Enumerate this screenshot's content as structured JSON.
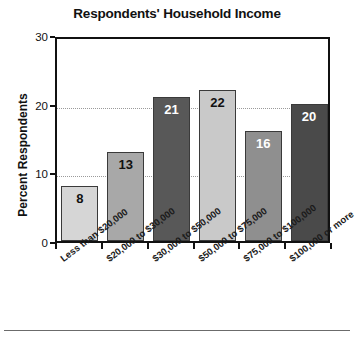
{
  "chart_data": {
    "type": "bar",
    "title": "Respondents' Household Income",
    "xlabel": "",
    "ylabel": "Percent Respondents",
    "ylim": [
      0,
      30
    ],
    "yticks": [
      0,
      10,
      20,
      30
    ],
    "gridlines": [
      10,
      20
    ],
    "grid": true,
    "legend": "none",
    "categories": [
      "Less than $20,000",
      "$20,000 to $30,000",
      "$30,000 to $50,000",
      "$50,000 to $75,000",
      "$75,000 to $100,000",
      "$100,000 or more"
    ],
    "values": [
      8,
      13,
      21,
      22,
      16,
      20
    ],
    "value_labels": [
      "8",
      "13",
      "21",
      "22",
      "16",
      "20"
    ],
    "bar_colors": [
      "#d6d6d6",
      "#a8a8a8",
      "#585858",
      "#c9c9c9",
      "#8f8f8f",
      "#4a4a4a"
    ],
    "label_colors": [
      "#111111",
      "#111111",
      "#ffffff",
      "#111111",
      "#ffffff",
      "#ffffff"
    ],
    "ytick_labels": [
      "0",
      "10",
      "20",
      "30"
    ]
  },
  "colors": {
    "axis": "#111111",
    "grid": "#9a9a9a",
    "background": "#ffffff",
    "bar_border": "#3a3a3a"
  }
}
